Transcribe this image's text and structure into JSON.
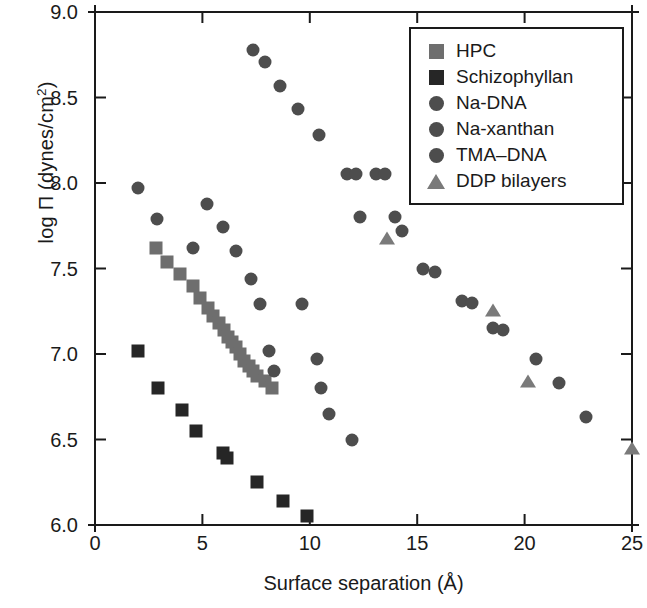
{
  "chart_data": {
    "type": "scatter",
    "title": "",
    "xlabel": "Surface separation (Å)",
    "ylabel": "log Π (dynes/cm2)",
    "ylabel_base": "log Π (dynes/cm",
    "ylabel_sup": "2",
    "ylabel_tail": ")",
    "xlim": [
      0,
      25
    ],
    "ylim": [
      6.0,
      9.0
    ],
    "xticks": [
      "0",
      "5",
      "10",
      "15",
      "20",
      "25"
    ],
    "xtick_values": [
      0,
      5,
      10,
      15,
      20,
      25
    ],
    "yticks": [
      "6.0",
      "6.5",
      "7.0",
      "7.5",
      "8.0",
      "8.5",
      "9.0"
    ],
    "ytick_values": [
      6.0,
      6.5,
      7.0,
      7.5,
      8.0,
      8.5,
      9.0
    ],
    "grid": false,
    "legend_position": "top-right",
    "series": [
      {
        "name": "HPC",
        "marker": "square",
        "color": "#6e6e6e",
        "points": [
          [
            2.85,
            7.62
          ],
          [
            3.35,
            7.54
          ],
          [
            3.95,
            7.47
          ],
          [
            4.55,
            7.4
          ],
          [
            4.9,
            7.33
          ],
          [
            5.25,
            7.27
          ],
          [
            5.5,
            7.22
          ],
          [
            5.75,
            7.18
          ],
          [
            6.0,
            7.14
          ],
          [
            6.2,
            7.1
          ],
          [
            6.4,
            7.07
          ],
          [
            6.55,
            7.04
          ],
          [
            6.75,
            7.0
          ],
          [
            6.95,
            6.96
          ],
          [
            7.15,
            6.93
          ],
          [
            7.35,
            6.9
          ],
          [
            7.55,
            6.87
          ],
          [
            7.9,
            6.84
          ],
          [
            8.25,
            6.8
          ]
        ]
      },
      {
        "name": "Schizophyllan",
        "marker": "square",
        "color": "#262626",
        "points": [
          [
            2.0,
            7.02
          ],
          [
            2.95,
            6.8
          ],
          [
            4.05,
            6.67
          ],
          [
            4.7,
            6.55
          ],
          [
            5.95,
            6.42
          ],
          [
            6.15,
            6.39
          ],
          [
            7.55,
            6.25
          ],
          [
            8.75,
            6.14
          ],
          [
            9.85,
            6.05
          ]
        ]
      },
      {
        "name": "Na-DNA",
        "marker": "circle",
        "color": "#4d4d4d",
        "points": [
          [
            13.1,
            8.05
          ],
          [
            13.5,
            8.05
          ],
          [
            13.95,
            7.8
          ],
          [
            14.3,
            7.72
          ],
          [
            15.25,
            7.5
          ],
          [
            15.85,
            7.48
          ],
          [
            17.1,
            7.31
          ],
          [
            17.55,
            7.3
          ],
          [
            18.55,
            7.15
          ],
          [
            19.0,
            7.14
          ],
          [
            20.55,
            6.97
          ],
          [
            21.6,
            6.83
          ],
          [
            22.85,
            6.63
          ]
        ]
      },
      {
        "name": "Na-xanthan",
        "marker": "circle",
        "color": "#4d4d4d",
        "points": [
          [
            2.0,
            7.97
          ],
          [
            2.9,
            7.79
          ],
          [
            4.55,
            7.62
          ],
          [
            5.2,
            7.88
          ],
          [
            5.95,
            7.74
          ],
          [
            6.55,
            7.6
          ],
          [
            7.25,
            7.44
          ],
          [
            7.7,
            7.29
          ],
          [
            8.1,
            7.02
          ],
          [
            8.35,
            6.9
          ],
          [
            9.65,
            7.29
          ],
          [
            10.35,
            6.97
          ],
          [
            10.5,
            6.8
          ],
          [
            10.9,
            6.65
          ],
          [
            11.95,
            6.5
          ]
        ]
      },
      {
        "name": "TMA–DNA",
        "marker": "circle",
        "color": "#4d4d4d",
        "points": [
          [
            7.35,
            8.78
          ],
          [
            7.9,
            8.71
          ],
          [
            8.6,
            8.57
          ],
          [
            9.45,
            8.43
          ],
          [
            10.45,
            8.28
          ],
          [
            11.75,
            8.05
          ],
          [
            12.15,
            8.05
          ],
          [
            12.35,
            7.8
          ]
        ]
      },
      {
        "name": "DDP bilayers",
        "marker": "triangle",
        "color": "#7a7a7a",
        "points": [
          [
            13.6,
            7.68
          ],
          [
            18.55,
            7.26
          ],
          [
            20.15,
            6.84
          ],
          [
            25.0,
            6.45
          ]
        ]
      }
    ],
    "legend": [
      {
        "label": "HPC",
        "marker": "square",
        "color": "#6e6e6e"
      },
      {
        "label": "Schizophyllan",
        "marker": "square",
        "color": "#262626"
      },
      {
        "label": "Na-DNA",
        "marker": "circle",
        "color": "#4d4d4d"
      },
      {
        "label": "Na-xanthan",
        "marker": "circle",
        "color": "#4d4d4d"
      },
      {
        "label": "TMA–DNA",
        "marker": "circle",
        "color": "#4d4d4d"
      },
      {
        "label": "DDP bilayers",
        "marker": "triangle",
        "color": "#7a7a7a"
      }
    ]
  },
  "axis_color": "#1a1a1a"
}
